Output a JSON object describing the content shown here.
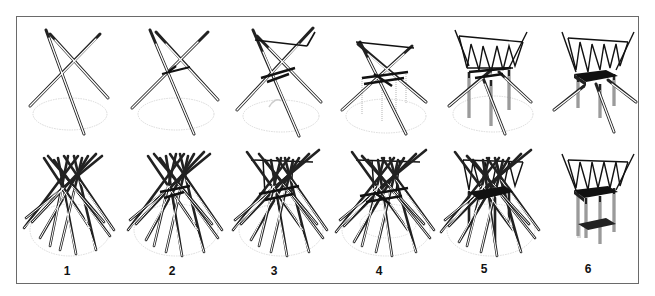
{
  "figure": {
    "header_text": "",
    "columns": [
      {
        "step": "1",
        "top": "tripod-3-poles",
        "bottom": "tipi-many-poles"
      },
      {
        "step": "2",
        "top": "tripod-crossed-lashing",
        "bottom": "tipi-with-lashing"
      },
      {
        "step": "3",
        "top": "tripod-top-ring",
        "bottom": "tipi-top-ring"
      },
      {
        "step": "4",
        "top": "tripod-with-scaffold-posts",
        "bottom": "tipi-with-scaffold"
      },
      {
        "step": "5",
        "top": "tower-with-zigzag-bracing",
        "bottom": "tipi-with-zigzag-bracing"
      },
      {
        "step": "6",
        "top": "finished-platform-tower",
        "bottom": "finished-two-level-tower"
      }
    ],
    "step_labels": [
      "1",
      "2",
      "3",
      "4",
      "5",
      "6"
    ],
    "colors": {
      "frame": "#6a6a6a",
      "ink": "#1a1a1a",
      "pole_fill": "#ffffff",
      "ground_ellipse": "#c8c8c8",
      "scaffold": "#b5b5b5"
    }
  }
}
